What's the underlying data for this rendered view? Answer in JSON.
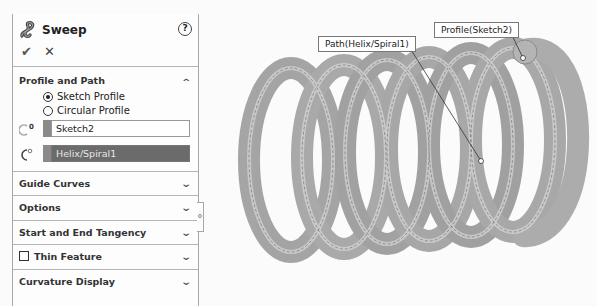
{
  "property_manager": {
    "title": "Sweep",
    "help_icon": "question-circle-icon",
    "ok_icon": "checkmark-icon",
    "cancel_icon": "x-icon",
    "sections": {
      "profile_and_path": {
        "label": "Profile and Path",
        "expanded": true,
        "options": [
          {
            "label": "Sketch Profile",
            "selected": true
          },
          {
            "label": "Circular Profile",
            "selected": false
          }
        ],
        "profile_field": {
          "value": "Sketch2",
          "icon": "profile-icon",
          "badge": "0"
        },
        "path_field": {
          "value": "Helix/Spiral1",
          "icon": "path-icon",
          "active": true
        }
      },
      "guide_curves": {
        "label": "Guide Curves"
      },
      "options": {
        "label": "Options"
      },
      "tangency": {
        "label": "Start and End Tangency"
      },
      "thin_feature": {
        "label": "Thin Feature",
        "checked": false
      },
      "curvature_display": {
        "label": "Curvature Display"
      }
    },
    "chevron_up": "^",
    "chevron_down": "v"
  },
  "viewport": {
    "callouts": {
      "path": "Path(Helix/Spiral1)",
      "profile": "Profile(Sketch2)"
    },
    "colors": {
      "spring_light": "#d0d0d0",
      "spring_mid": "#9a9a9a",
      "spring_dark": "#6a6a6a",
      "active_field": "#6b6b6b"
    }
  }
}
